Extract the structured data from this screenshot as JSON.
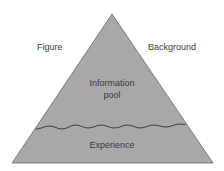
{
  "diagram": {
    "type": "triangle",
    "labels": {
      "left": "Figure",
      "right": "Background",
      "upper_region": [
        "Information",
        "pool"
      ],
      "lower_region": "Experience"
    },
    "colors": {
      "fill": "#a8a8a8",
      "stroke": "#555555",
      "wave": "#3c3c3c",
      "text": "#3a3a3a"
    },
    "geometry": {
      "apex": [
        112,
        14
      ],
      "base_left": [
        12,
        163
      ],
      "base_right": [
        213,
        163
      ],
      "wave_y": 127
    }
  }
}
